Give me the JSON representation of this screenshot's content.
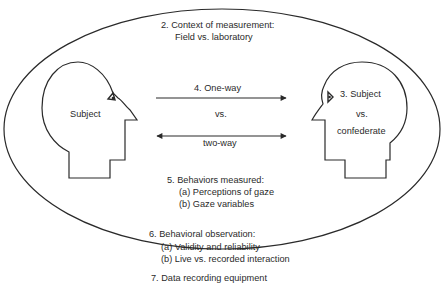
{
  "diagram": {
    "context": {
      "line1": "2.  Context of measurement:",
      "line2": "Field vs. laboratory"
    },
    "left_head": {
      "label": "Subject"
    },
    "right_head": {
      "line1": "3.  Subject",
      "line2": "vs.",
      "line3": "confederate"
    },
    "gaze_direction": {
      "one_way": "4.  One-way",
      "vs": "vs.",
      "two_way": "two-way"
    },
    "behaviors_measured": {
      "title": "5.  Behaviors measured:",
      "items": [
        "(a)  Perceptions of gaze",
        "(b)  Gaze variables"
      ]
    },
    "behavioral_observation": {
      "title": "6.  Behavioral observation:",
      "items": [
        "(a)  Validity and reliability",
        "(b)  Live vs. recorded interaction"
      ]
    },
    "equipment": {
      "title": "7.  Data recording equipment"
    },
    "colors": {
      "stroke": "#2a2a2a",
      "background": "#ffffff"
    }
  }
}
